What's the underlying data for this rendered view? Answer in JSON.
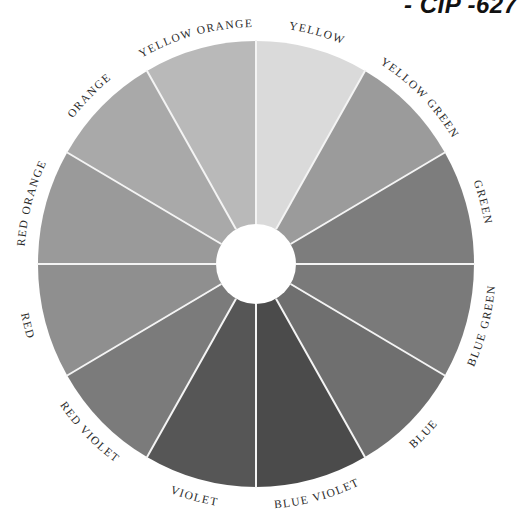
{
  "page": {
    "corner_code": "- CIP -627"
  },
  "wheel": {
    "center": [
      256,
      264
    ],
    "outer_radius_x": 218,
    "outer_radius_y": 223,
    "inner_radius": 40,
    "divider_color": "#f4f4f4",
    "background": "#ffffff",
    "segments": [
      {
        "label": "YELLOW",
        "start_deg": -90,
        "end_deg": -60,
        "fill": "#dadada"
      },
      {
        "label": "YELLOW GREEN",
        "start_deg": -60,
        "end_deg": -30,
        "fill": "#9b9b9b"
      },
      {
        "label": "GREEN",
        "start_deg": -30,
        "end_deg": 0,
        "fill": "#7d7d7d"
      },
      {
        "label": "BLUE GREEN",
        "start_deg": 0,
        "end_deg": 30,
        "fill": "#7a7a7a"
      },
      {
        "label": "BLUE",
        "start_deg": 30,
        "end_deg": 60,
        "fill": "#6f6f6f"
      },
      {
        "label": "BLUE VIOLET",
        "start_deg": 60,
        "end_deg": 90,
        "fill": "#4b4b4b"
      },
      {
        "label": "VIOLET",
        "start_deg": 90,
        "end_deg": 120,
        "fill": "#565656"
      },
      {
        "label": "RED VIOLET",
        "start_deg": 120,
        "end_deg": 150,
        "fill": "#7b7b7b"
      },
      {
        "label": "RED",
        "start_deg": 150,
        "end_deg": 180,
        "fill": "#8f8f8f"
      },
      {
        "label": "RED ORANGE",
        "start_deg": 180,
        "end_deg": 210,
        "fill": "#9a9a9a"
      },
      {
        "label": "ORANGE",
        "start_deg": 210,
        "end_deg": 240,
        "fill": "#a9a9a9"
      },
      {
        "label": "YELLOW ORANGE",
        "start_deg": 240,
        "end_deg": 270,
        "fill": "#b9b9b9"
      }
    ]
  }
}
